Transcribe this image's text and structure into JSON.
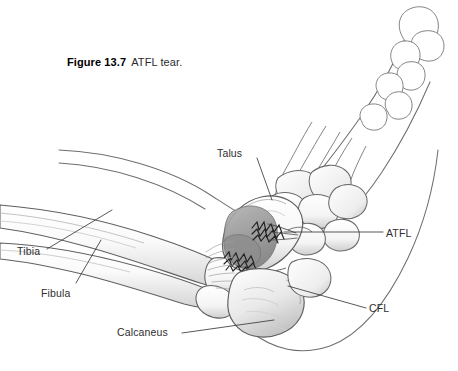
{
  "figure": {
    "number_label": "Figure 13.7",
    "caption_text": "ATFL tear.",
    "background_color": "#ffffff",
    "line_color": "#555555",
    "label_color": "#2e2e2e"
  },
  "annotations": {
    "talus": "Talus",
    "atfl": "ATFL",
    "cfl": "CFL",
    "tibia": "Tibia",
    "fibula": "Fibula",
    "calcaneus": "Calcaneus"
  },
  "illustration": {
    "style": "pencil line drawing with graphite shading",
    "torn_ligament_shading": "#9a9a9a",
    "bone_shading": "#d8d8d8",
    "outline_stroke": "#6a6a6a",
    "leader_line_stroke": "#3a3a3a"
  }
}
